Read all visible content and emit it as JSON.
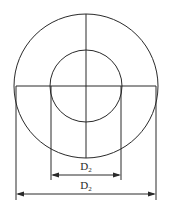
{
  "diagram": {
    "type": "concentric-circles-dimension-drawing",
    "stroke_color": "#2a2a2a",
    "background": "#ffffff",
    "outer_circle": {
      "cx": 86,
      "cy": 86,
      "r": 72
    },
    "inner_circle": {
      "cx": 86,
      "cy": 86,
      "r": 36
    },
    "dimensions": [
      {
        "name": "inner-diameter",
        "label_main": "D",
        "label_sub": "2",
        "y": 175,
        "x1": 51,
        "x2": 121
      },
      {
        "name": "outer-diameter",
        "label_main": "D",
        "label_sub": "2",
        "y": 194,
        "x1": 16,
        "x2": 156
      }
    ]
  }
}
